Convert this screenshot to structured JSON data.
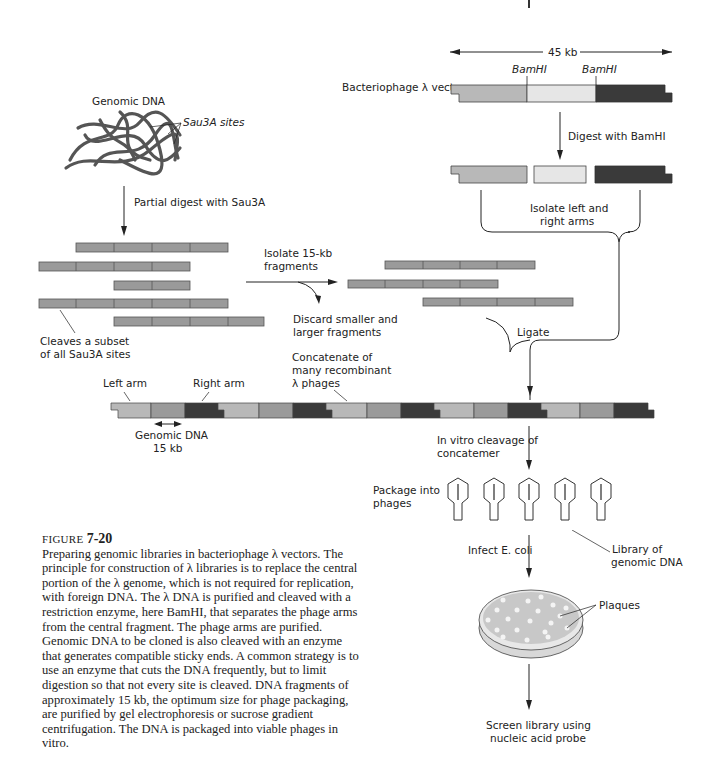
{
  "page_header": {
    "running_title": "The Isolation of Cloned Genes",
    "page_number": "125"
  },
  "figure": {
    "label": "FIGURE",
    "number": "7-20",
    "labels": {
      "vector_size": "45 kb",
      "bamhi_1": "BamHI",
      "bamhi_2": "BamHI",
      "vector": "Bacteriophage λ vector",
      "digest_bamhi": "Digest with BamHI",
      "isolate_arms_1": "Isolate left and",
      "isolate_arms_2": "right arms",
      "genomic_dna": "Genomic DNA",
      "sau3a_sites": "Sau3A sites",
      "partial_digest": "Partial digest with Sau3A",
      "cleaves_1": "Cleaves a subset",
      "cleaves_2": "of all Sau3A sites",
      "isolate_15kb_1": "Isolate 15-kb",
      "isolate_15kb_2": "fragments",
      "discard_1": "Discard smaller and",
      "discard_2": "larger fragments",
      "ligate": "Ligate",
      "concatenate_1": "Concatenate of",
      "concatenate_2": "many recombinant",
      "concatenate_3": "λ phages",
      "left_arm": "Left arm",
      "right_arm": "Right arm",
      "genomic_dna_insert": "Genomic DNA",
      "insert_size": "15 kb",
      "in_vitro_1": "In vitro cleavage of",
      "in_vitro_2": "concatemer",
      "package_1": "Package into",
      "package_2": "phages",
      "infect": "Infect E. coli",
      "library_1": "Library of",
      "library_2": "genomic DNA",
      "plaques": "Plaques",
      "screen_1": "Screen library using",
      "screen_2": "nucleic acid probe"
    },
    "colors": {
      "left_arm": "#b8b8b8",
      "stuffer": "#e6e6e6",
      "right_arm": "#3a3a3a",
      "genomic_fragment": "#9a9a9a",
      "plate": "#c8c8c8"
    },
    "caption": "Preparing genomic libraries in bacteriophage λ vectors. The principle for construction of λ libraries is to replace the central portion of the λ genome, which is not required for replication, with foreign DNA. The λ DNA is purified and cleaved with a restriction enzyme, here BamHI, that separates the phage arms from the central fragment. The phage arms are purified. Genomic DNA to be cloned is also cleaved with an enzyme that generates compatible sticky ends. A common strategy is to use an enzyme that cuts the DNA frequently, but to limit digestion so that not every site is cleaved. DNA fragments of approximately 15 kb, the optimum size for phage packaging, are purified by gel electrophoresis or sucrose gradient centrifugation. The DNA is packaged into viable phages in vitro."
  }
}
